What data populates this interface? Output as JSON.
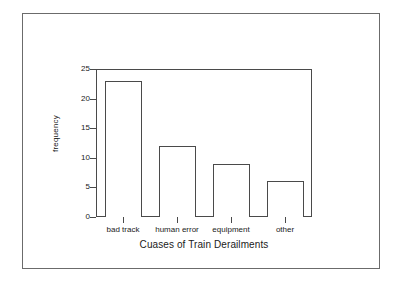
{
  "chart_data": {
    "type": "bar",
    "title": "",
    "xlabel": "Cuases of Train Derailments",
    "ylabel": "frequency",
    "categories": [
      "bad track",
      "human error",
      "equipment",
      "other"
    ],
    "values": [
      23,
      12,
      9,
      6
    ],
    "ylim": [
      0,
      25
    ],
    "yticks": [
      0,
      5,
      10,
      15,
      20,
      25
    ],
    "ytick_labels": [
      "0",
      "5",
      "10",
      "15",
      "20",
      "25"
    ],
    "grid": false,
    "legend": "none",
    "bar_fill_color": "#ffffff",
    "bar_edge_color": "#4a4a4a",
    "frame_color": "#4a4a4a",
    "border_color": "#6b6b6b",
    "background_color": "#ffffff"
  }
}
